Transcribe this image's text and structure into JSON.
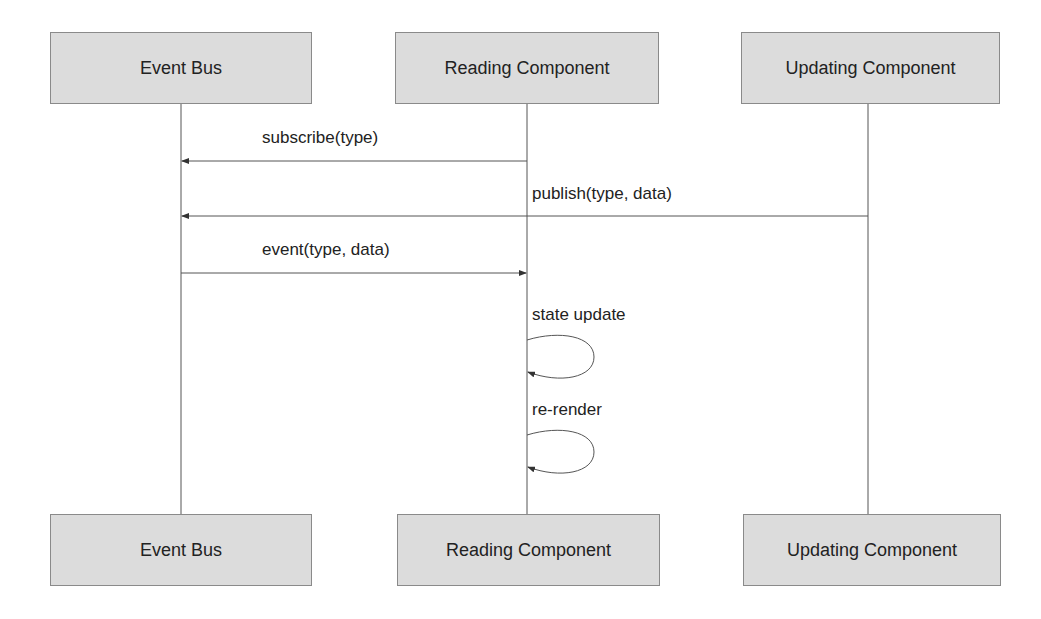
{
  "diagram": {
    "type": "sequence",
    "participants": [
      {
        "id": "bus",
        "label": "Event Bus"
      },
      {
        "id": "reader",
        "label": "Reading Component"
      },
      {
        "id": "updater",
        "label": "Updating Component"
      }
    ],
    "messages": [
      {
        "from": "reader",
        "to": "bus",
        "label": "subscribe(type)"
      },
      {
        "from": "updater",
        "to": "bus",
        "label": "publish(type, data)"
      },
      {
        "from": "bus",
        "to": "reader",
        "label": "event(type, data)"
      },
      {
        "from": "reader",
        "to": "reader",
        "label": "state update"
      },
      {
        "from": "reader",
        "to": "reader",
        "label": "re-render"
      }
    ]
  }
}
